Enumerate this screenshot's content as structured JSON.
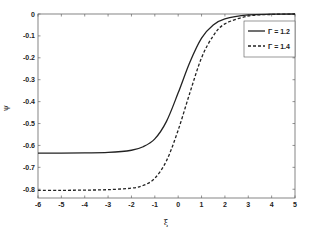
{
  "chart_data": {
    "type": "line",
    "title": "",
    "xlabel": "ξ",
    "ylabel": "ψ",
    "xlim": [
      -6,
      5
    ],
    "ylim": [
      -0.84,
      0
    ],
    "xticks": [
      -6,
      -5,
      -4,
      -3,
      -2,
      -1,
      0,
      1,
      2,
      3,
      4,
      5
    ],
    "yticks": [
      0,
      -0.1,
      -0.2,
      -0.3,
      -0.4,
      -0.5,
      -0.6,
      -0.7,
      -0.8
    ],
    "ytick_labels": [
      "0",
      "-0.1",
      "-0.2",
      "-0.3",
      "-0.4",
      "-0.5",
      "-0.6",
      "-0.7",
      "-0.8"
    ],
    "grid": false,
    "legend_position": "upper right",
    "x": [
      -6,
      -5,
      -4,
      -3,
      -2,
      -1.5,
      -1,
      -0.5,
      0,
      0.5,
      1,
      1.5,
      2,
      3,
      4,
      5
    ],
    "series": [
      {
        "name": "Γ = 1.2",
        "style": "solid",
        "values": [
          -0.635,
          -0.635,
          -0.634,
          -0.632,
          -0.622,
          -0.606,
          -0.57,
          -0.49,
          -0.36,
          -0.22,
          -0.11,
          -0.05,
          -0.022,
          -0.004,
          -0.001,
          0
        ]
      },
      {
        "name": "Γ = 1.4",
        "style": "dashed",
        "values": [
          -0.805,
          -0.805,
          -0.804,
          -0.802,
          -0.795,
          -0.783,
          -0.75,
          -0.67,
          -0.53,
          -0.36,
          -0.2,
          -0.1,
          -0.045,
          -0.009,
          -0.002,
          0
        ]
      }
    ]
  },
  "axes": {
    "xlabel": "ξ",
    "ylabel": "ψ"
  },
  "legend": {
    "items": [
      {
        "label": "Γ = 1.2"
      },
      {
        "label": "Γ = 1.4"
      }
    ]
  }
}
